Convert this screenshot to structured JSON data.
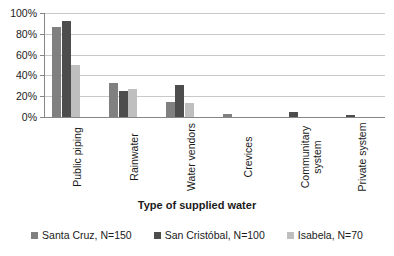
{
  "chart_data": {
    "type": "bar",
    "title": "",
    "subtitle": "",
    "xlabel": "Type of supplied water",
    "ylabel": "",
    "categories": [
      "Public piping",
      "Rainwater",
      "Water vendors",
      "Crevices",
      "Communitary system",
      "Private system"
    ],
    "series": [
      {
        "name": "Santa Cruz, N=150",
        "color": "#808080",
        "values": [
          87,
          33,
          14,
          3,
          0,
          0
        ]
      },
      {
        "name": "San Cristóbal, N=100",
        "color": "#4d4d4d",
        "values": [
          92,
          25,
          31,
          0,
          5,
          2
        ]
      },
      {
        "name": "Isabela, N=70",
        "color": "#bfbfbf",
        "values": [
          50,
          27,
          13,
          0,
          0,
          0
        ]
      }
    ],
    "ylim": [
      0,
      100
    ],
    "yticks": [
      0,
      20,
      40,
      60,
      80,
      100
    ],
    "ytick_labels": [
      "0%",
      "20%",
      "40%",
      "60%",
      "80%",
      "100%"
    ],
    "grid": true,
    "grid_axis": "y",
    "legend_position": "bottom",
    "legend_entries": [
      "Santa Cruz, N=150",
      "San Cristóbal, N=100",
      "Isabela, N=70"
    ],
    "value_unit": "%",
    "background_color": "#ffffff",
    "gridline_color": "#c9c9c9",
    "axis_color": "#868686"
  }
}
